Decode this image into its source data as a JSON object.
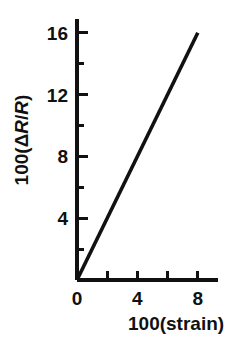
{
  "chart_data": {
    "type": "line",
    "title": "",
    "xlabel": "100(strain)",
    "ylabel": "100(ΔR/R)",
    "ylabel_parts": {
      "prefix": "100(",
      "delta": "Δ",
      "r1": "R",
      "slash": "/",
      "r2": "R",
      "suffix": ")"
    },
    "xlim": [
      0,
      9.33
    ],
    "ylim": [
      0,
      16.65
    ],
    "x_ticks_major": [
      0,
      4,
      8
    ],
    "x_tick_labels": [
      "0",
      "4",
      "8"
    ],
    "x_ticks_minor": [
      2,
      6
    ],
    "y_ticks_major": [
      4,
      8,
      12,
      16
    ],
    "y_tick_labels": [
      "4",
      "8",
      "12",
      "16"
    ],
    "y_ticks_minor": [
      2,
      6,
      10,
      14
    ],
    "grid": false,
    "legend": false,
    "series": [
      {
        "name": "resistance-vs-strain",
        "color": "#111111",
        "x": [
          0,
          8
        ],
        "y": [
          0,
          16
        ],
        "slope": 2.0
      }
    ],
    "line_color": "#111111",
    "axis_color": "#111111"
  },
  "axes_geometry": {
    "origin_x": 77,
    "origin_y": 280,
    "x_px_per_unit": 15.1,
    "y_px_per_unit": 15.45,
    "x_axis_end_px": 218,
    "y_axis_top_px": 19
  },
  "ticks_render": {
    "y": [
      {
        "value": 16,
        "major": true,
        "label": "16"
      },
      {
        "value": 14,
        "major": false,
        "label": ""
      },
      {
        "value": 12,
        "major": true,
        "label": "12"
      },
      {
        "value": 10,
        "major": false,
        "label": ""
      },
      {
        "value": 8,
        "major": true,
        "label": "8"
      },
      {
        "value": 6,
        "major": false,
        "label": ""
      },
      {
        "value": 4,
        "major": true,
        "label": "4"
      },
      {
        "value": 2,
        "major": false,
        "label": ""
      }
    ],
    "x": [
      {
        "value": 0,
        "major": true,
        "label": "0"
      },
      {
        "value": 2,
        "major": false,
        "label": ""
      },
      {
        "value": 4,
        "major": true,
        "label": "4"
      },
      {
        "value": 6,
        "major": false,
        "label": ""
      },
      {
        "value": 8,
        "major": true,
        "label": "8"
      }
    ]
  }
}
